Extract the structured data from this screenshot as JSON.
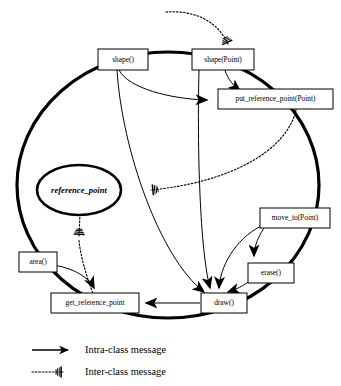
{
  "diagram": {
    "accent_color": "#000000",
    "background_color": "#ffffff",
    "class_boundary": {
      "name": "shape-class-boundary",
      "shape": "ellipse"
    },
    "attributes": [
      {
        "id": "reference_point",
        "label": "reference_point",
        "style": "italic"
      }
    ],
    "operations": [
      {
        "id": "shape",
        "label": "shape()"
      },
      {
        "id": "shape_point",
        "label": "shape(Point)"
      },
      {
        "id": "put_reference_point",
        "label": "put_reference_point(Point)"
      },
      {
        "id": "move_to",
        "label": "move_to(Point)"
      },
      {
        "id": "erase",
        "label": "erase()"
      },
      {
        "id": "area",
        "label": "area()"
      },
      {
        "id": "get_reference_point",
        "label": "get_reference_point"
      },
      {
        "id": "draw",
        "label": "draw()"
      }
    ],
    "messages": [
      {
        "from": "shape",
        "to": "put_reference_point",
        "kind": "intra"
      },
      {
        "from": "shape_point",
        "to": "put_reference_point",
        "kind": "intra"
      },
      {
        "from": "shape",
        "to": "draw",
        "kind": "intra"
      },
      {
        "from": "shape_point",
        "to": "draw",
        "kind": "intra"
      },
      {
        "from": "move_to",
        "to": "erase",
        "kind": "intra"
      },
      {
        "from": "move_to",
        "to": "draw",
        "kind": "intra"
      },
      {
        "from": "erase",
        "to": "draw",
        "kind": "intra"
      },
      {
        "from": "area",
        "to": "get_reference_point",
        "kind": "intra"
      },
      {
        "from": "draw",
        "to": "get_reference_point",
        "kind": "intra"
      },
      {
        "from": "external",
        "to": "shape_point",
        "kind": "inter"
      },
      {
        "from": "put_reference_point",
        "to": "reference_point",
        "kind": "inter"
      },
      {
        "from": "reference_point",
        "to": "area",
        "kind": "inter"
      },
      {
        "from": "get_reference_point",
        "to": "reference_point",
        "kind": "inter"
      }
    ]
  },
  "legend": {
    "name": "message-type-legend",
    "items": [
      {
        "id": "intra",
        "label": "Intra-class message",
        "line_style": "solid"
      },
      {
        "id": "inter",
        "label": "Inter-class message",
        "line_style": "dotted"
      }
    ]
  }
}
